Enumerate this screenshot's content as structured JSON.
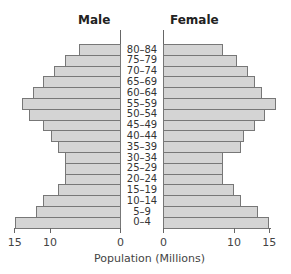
{
  "chart_data": {
    "type": "bar",
    "subtype": "population-pyramid",
    "title": "",
    "left_label": "Male",
    "right_label": "Female",
    "xlabel": "Population (Millions)",
    "ylabel": "",
    "categories": [
      "80–84",
      "75–79",
      "70–74",
      "65–69",
      "60–64",
      "55–59",
      "50–54",
      "45–49",
      "40–44",
      "35–39",
      "30–34",
      "25–29",
      "20–24",
      "15–19",
      "10–14",
      "5–9",
      "0–4"
    ],
    "series": [
      {
        "name": "Male",
        "values": [
          6,
          8,
          9.5,
          11,
          12.5,
          14,
          13,
          11,
          10,
          9,
          8,
          8,
          8,
          9,
          11,
          12,
          15
        ]
      },
      {
        "name": "Female",
        "values": [
          8.5,
          10.5,
          12,
          13,
          14,
          16,
          14.5,
          13,
          11.5,
          11,
          8.5,
          8.5,
          8.5,
          10,
          11,
          13.5,
          15
        ]
      }
    ],
    "xlim": [
      0,
      15
    ],
    "left_ticks": [
      "15",
      "10",
      "0"
    ],
    "right_ticks": [
      "0",
      "10",
      "15"
    ],
    "grid": false,
    "legend": "none",
    "colors": {
      "bar_fill": "#d4d4d4",
      "bar_border": "#777777"
    }
  }
}
